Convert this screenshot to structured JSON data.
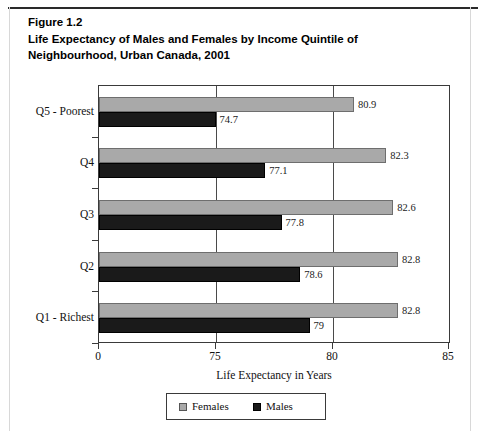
{
  "figure": {
    "title_lines": [
      "Figure 1.2",
      "Life Expectancy of Males and Females by Income Quintile of",
      "Neighbourhood, Urban Canada, 2001"
    ]
  },
  "chart_data": {
    "type": "bar",
    "orientation": "horizontal",
    "title": "Figure 1.2 Life Expectancy of Males and Females by Income Quintile of Neighbourhood, Urban Canada, 2001",
    "xlabel": "Life Expectancy in Years",
    "ylabel": "",
    "categories": [
      "Q1 - Richest",
      "Q2",
      "Q3",
      "Q4",
      "Q5 - Poorest"
    ],
    "category_order_top_to_bottom": [
      "Q5 - Poorest",
      "Q4",
      "Q3",
      "Q2",
      "Q1 - Richest"
    ],
    "series": [
      {
        "name": "Females",
        "color": "#a9a9a9",
        "values": [
          82.8,
          82.8,
          82.6,
          82.3,
          80.9
        ],
        "labels": [
          "82.8",
          "82.8",
          "82.6",
          "82.3",
          "80.9"
        ]
      },
      {
        "name": "Males",
        "color": "#1a1a1a",
        "values": [
          79,
          78.6,
          77.8,
          77.1,
          74.7
        ],
        "labels": [
          "79",
          "78.6",
          "77.8",
          "77.1",
          "74.7"
        ]
      }
    ],
    "xticks": [
      0,
      75,
      80,
      85
    ],
    "xtick_labels": [
      "0",
      "75",
      "80",
      "85"
    ],
    "xlim": [
      0,
      85
    ],
    "axis_note": "broken axis: 0 then 75, 80, 85 evenly spaced",
    "grid": true,
    "legend_position": "bottom",
    "legend_entries": [
      "Females",
      "Males"
    ]
  },
  "legend": {
    "females_label": "Females",
    "males_label": "Males"
  }
}
